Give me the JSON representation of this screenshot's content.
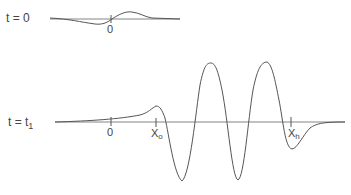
{
  "diagram": {
    "panels": [
      {
        "label": "t = 0",
        "ticks": [
          {
            "label": "0"
          }
        ]
      },
      {
        "label": "t = t",
        "label_subscript": "1",
        "ticks": [
          {
            "label": "0"
          },
          {
            "label": "X",
            "subscript": "o"
          },
          {
            "label": "X",
            "subscript": "h"
          }
        ]
      }
    ]
  },
  "colors": {
    "line": "#555555",
    "background": "#ffffff"
  }
}
